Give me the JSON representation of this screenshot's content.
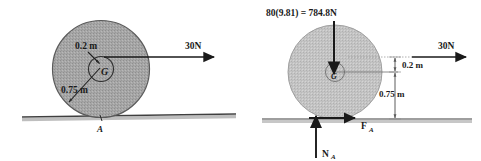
{
  "figure": {
    "title": "",
    "panels": [
      {
        "id": "left-panel",
        "name": "physical-diagram",
        "labels": {
          "applied_force": "30N",
          "inner_radius": "0.2 m",
          "outer_radius": "0.75 m",
          "center_point": "G",
          "contact_point": "A"
        }
      },
      {
        "id": "right-panel",
        "name": "free-body-diagram",
        "labels": {
          "weight": "80(9.81) = 784.8N",
          "applied_force": "30N",
          "dim_small": "0.2 m",
          "dim_large": "0.75 m",
          "center_point": "G",
          "friction_force": "F",
          "friction_subscript": "A",
          "normal_force": "N",
          "normal_subscript": "A"
        }
      }
    ]
  },
  "colors": {
    "ink": "#1a1a1a",
    "wheel_fill": "#a8a8a8",
    "wheel_fill_right": "#c2c2c2",
    "wheel_stroke": "#555555",
    "ground": "#4a4a4a",
    "dimension": "#6a6a6a",
    "background": "#ffffff"
  }
}
